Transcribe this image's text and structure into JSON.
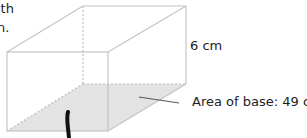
{
  "intro_text": {
    "line1_fragment": "ith",
    "line2_fragment": "n."
  },
  "figure": {
    "shape": "rectangular prism",
    "height_label": "6 cm",
    "base_area_label": "Area of base: 49 cm",
    "base_area_unit_exponent": "2",
    "colors": {
      "edge": "#c4c4c4",
      "hidden_edge": "#c4c4c4",
      "base_fill": "#e3e3e3",
      "leader_line": "#555555",
      "pen_stroke": "#111111"
    }
  }
}
